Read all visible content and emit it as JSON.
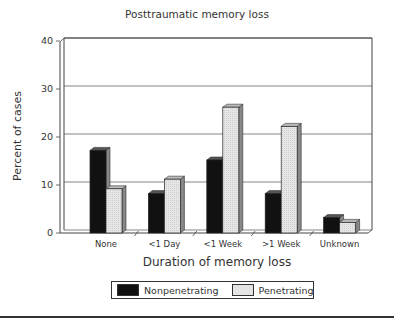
{
  "chart_data": {
    "type": "bar",
    "title": "Posttraumatic memory loss",
    "xlabel": "Duration of memory loss",
    "ylabel": "Percent of cases",
    "ylim": [
      0,
      40
    ],
    "yticks": [
      0,
      10,
      20,
      30,
      40
    ],
    "grid": true,
    "style": "3d-clustered-bar",
    "legend_position": "bottom",
    "categories": [
      "None",
      "<1 Day",
      "<1 Week",
      ">1 Week",
      "Unknown"
    ],
    "series": [
      {
        "name": "Nonpenetrating",
        "color": "#111111",
        "values": [
          17,
          8,
          15,
          8,
          3
        ]
      },
      {
        "name": "Penetrating",
        "color": "#e4e4e4",
        "values": [
          9,
          11,
          26,
          22,
          2
        ]
      }
    ]
  },
  "legend": {
    "items": [
      {
        "label": "Nonpenetrating",
        "color": "#111111"
      },
      {
        "label": "Penetrating",
        "color": "#e4e4e4"
      }
    ]
  }
}
